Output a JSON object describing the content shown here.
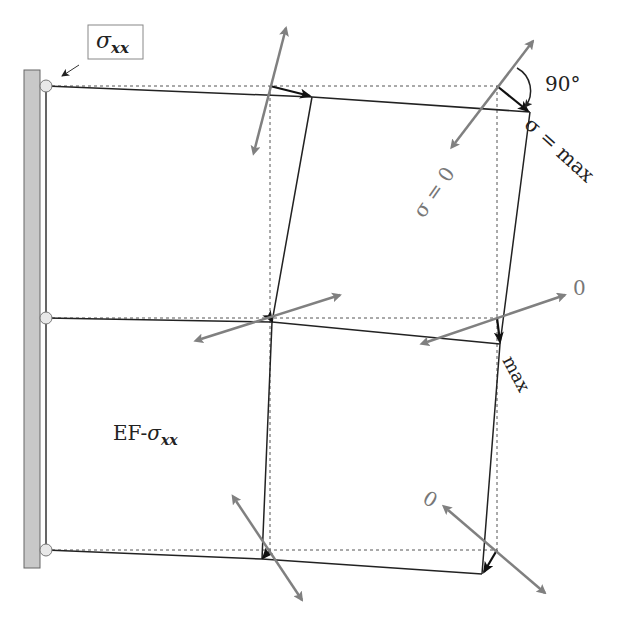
{
  "diagram": {
    "title_box": {
      "symbol": "σ",
      "subscript": "xx"
    },
    "element_label": {
      "prefix": "EF-",
      "symbol": "σ",
      "subscript": "xx"
    },
    "angle_label": "90°",
    "labels": {
      "sigma_max": "σ = max",
      "sigma_zero": "σ = 0",
      "mid_right_zero": "0",
      "mid_right_max": "max",
      "bottom_zero": "0"
    },
    "colors": {
      "wall_fill": "#c8c8c8",
      "wall_stroke": "#666666",
      "deformed_line": "#222222",
      "dashed_line": "#555555",
      "principal_arrow": "#808080",
      "displacement_arrow": "#111111",
      "node_fill": "#e8e8e8"
    },
    "nodes_undeformed": [
      [
        46,
        86
      ],
      [
        270,
        86
      ],
      [
        497,
        86
      ],
      [
        46,
        318
      ],
      [
        270,
        318
      ],
      [
        497,
        318
      ],
      [
        46,
        550
      ],
      [
        270,
        550
      ],
      [
        497,
        550
      ]
    ],
    "nodes_deformed": [
      [
        46,
        86
      ],
      [
        312,
        97
      ],
      [
        530,
        112
      ],
      [
        46,
        318
      ],
      [
        272,
        322
      ],
      [
        500,
        344
      ],
      [
        46,
        550
      ],
      [
        262,
        559
      ],
      [
        482,
        574
      ]
    ]
  }
}
